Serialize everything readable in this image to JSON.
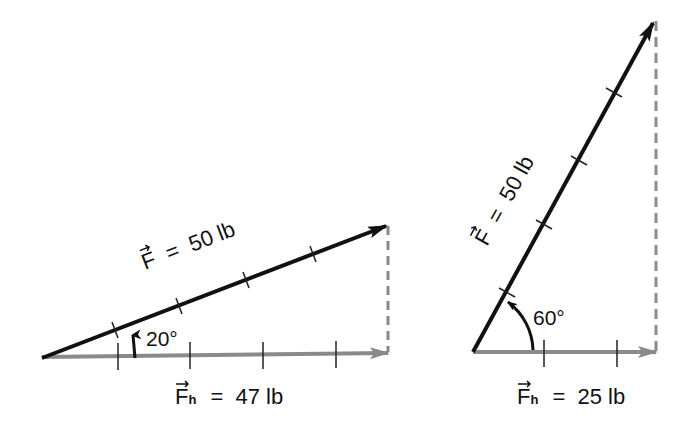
{
  "colors": {
    "force_vector": "#111111",
    "horizontal_component": "#8a8a8a",
    "dashed_projection": "#8a8a8a",
    "background": "#ffffff"
  },
  "diagrams": [
    {
      "id": "left",
      "force": {
        "symbol": "F",
        "equals": "=",
        "value": "50 lb"
      },
      "angle_label": "20°",
      "component": {
        "symbol": "F",
        "subscript": "h",
        "equals": "=",
        "value": "47 lb"
      },
      "force_ticks": 4,
      "component_ticks": 4
    },
    {
      "id": "right",
      "force": {
        "symbol": "F",
        "equals": "=",
        "value": "50 lb"
      },
      "angle_label": "60°",
      "component": {
        "symbol": "F",
        "subscript": "h",
        "equals": "=",
        "value": "25 lb"
      },
      "force_ticks": 4,
      "component_ticks": 2
    }
  ]
}
